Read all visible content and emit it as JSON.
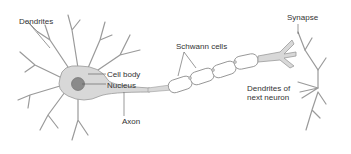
{
  "labels": {
    "dendrites": "Dendrites",
    "cell_body": "Cell body",
    "nucleus": "Nucleus",
    "axon": "Axon",
    "schwann_cells": "Schwann cells",
    "synapse": "Synapse",
    "dendrites_next_line1": "Dendrites of",
    "dendrites_next_line2": "next neuron"
  },
  "colors": {
    "cell_fill": "#d8d8d8",
    "cell_outline": "#9a9a9a",
    "nucleus_fill": "#8a8a8a",
    "label_text": "#333333",
    "background": "#ffffff"
  }
}
